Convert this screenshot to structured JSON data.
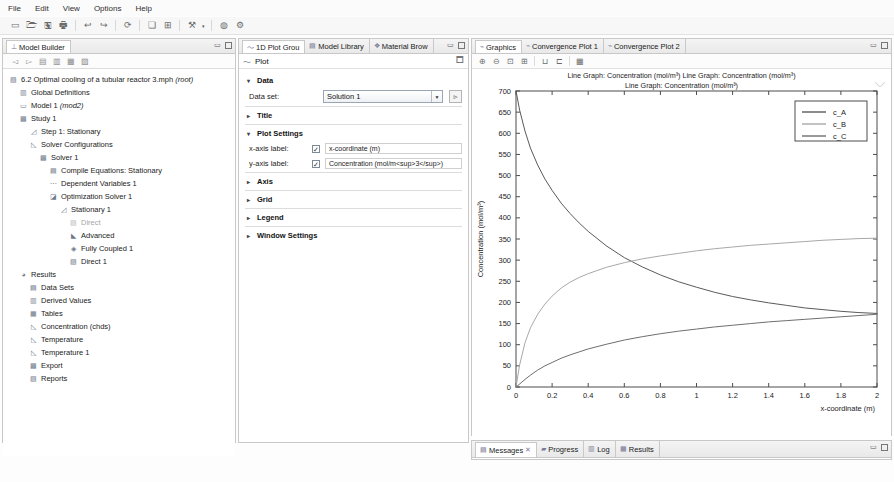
{
  "menubar": {
    "items": [
      {
        "label": "File"
      },
      {
        "label": "Edit"
      },
      {
        "label": "View"
      },
      {
        "label": "Options"
      },
      {
        "label": "Help"
      }
    ]
  },
  "toolbar": {
    "buttons": [
      {
        "name": "new-icon",
        "glyph": "▭"
      },
      {
        "name": "open-icon",
        "glyph": "🗁"
      },
      {
        "name": "save-icon",
        "glyph": "🖫"
      },
      {
        "name": "print-icon",
        "glyph": "🖶"
      },
      {
        "name": "undo-icon",
        "glyph": "↩"
      },
      {
        "name": "redo-icon",
        "glyph": "↪"
      },
      {
        "name": "refresh-icon",
        "glyph": "⟳"
      },
      {
        "name": "window-icon",
        "glyph": "❏"
      },
      {
        "name": "layout-icon",
        "glyph": "⊞"
      },
      {
        "name": "build-icon",
        "glyph": "⚒"
      },
      {
        "name": "dropdown-arrow-icon",
        "glyph": "▾"
      },
      {
        "name": "help-icon",
        "glyph": "◍"
      },
      {
        "name": "settings-icon",
        "glyph": "⚙"
      }
    ]
  },
  "model_builder": {
    "tab_label": "Model Builder",
    "tab_icon": "tree-icon",
    "toolbar_icons": [
      {
        "name": "collapse-icon",
        "glyph": "◅"
      },
      {
        "name": "expand-icon",
        "glyph": "▻"
      },
      {
        "name": "show-all-icon",
        "glyph": "▤"
      },
      {
        "name": "filter-icon",
        "glyph": "▥"
      },
      {
        "name": "group-icon",
        "glyph": "▦"
      },
      {
        "name": "list-icon",
        "glyph": "▨"
      }
    ],
    "tree": [
      {
        "label": "6.2 Optimal cooling of a tubular reactor 3.mph (root)",
        "indent": 0,
        "icon": "root-icon",
        "dim": false
      },
      {
        "label": "Global Definitions",
        "indent": 1,
        "icon": "globe-icon",
        "dim": false
      },
      {
        "label": "Model 1 (mod2)",
        "indent": 1,
        "icon": "model-icon",
        "dim": false
      },
      {
        "label": "Study 1",
        "indent": 1,
        "icon": "study-icon",
        "dim": false
      },
      {
        "label": "Step 1: Stationary",
        "indent": 2,
        "icon": "step-icon",
        "dim": false
      },
      {
        "label": "Solver Configurations",
        "indent": 2,
        "icon": "solver-config-icon",
        "dim": false
      },
      {
        "label": "Solver 1",
        "indent": 3,
        "icon": "solver-icon",
        "dim": false
      },
      {
        "label": "Compile Equations: Stationary",
        "indent": 4,
        "icon": "compile-icon",
        "dim": false
      },
      {
        "label": "Dependent Variables 1",
        "indent": 4,
        "icon": "variables-icon",
        "dim": false
      },
      {
        "label": "Optimization Solver 1",
        "indent": 4,
        "icon": "optimization-icon",
        "dim": false
      },
      {
        "label": "Stationary 1",
        "indent": 5,
        "icon": "stationary-icon",
        "dim": false
      },
      {
        "label": "Direct",
        "indent": 6,
        "icon": "direct-icon",
        "dim": true
      },
      {
        "label": "Advanced",
        "indent": 6,
        "icon": "advanced-icon",
        "dim": false
      },
      {
        "label": "Fully Coupled 1",
        "indent": 6,
        "icon": "fully-coupled-icon",
        "dim": false
      },
      {
        "label": "Direct 1",
        "indent": 6,
        "icon": "direct-icon",
        "dim": false
      },
      {
        "label": "Results",
        "indent": 1,
        "icon": "results-icon",
        "dim": false
      },
      {
        "label": "Data Sets",
        "indent": 2,
        "icon": "data-sets-icon",
        "dim": false
      },
      {
        "label": "Derived Values",
        "indent": 2,
        "icon": "derived-values-icon",
        "dim": false
      },
      {
        "label": "Tables",
        "indent": 2,
        "icon": "tables-icon",
        "dim": false
      },
      {
        "label": "Concentration (chds)",
        "indent": 2,
        "icon": "plot-group-icon",
        "dim": false
      },
      {
        "label": "Temperature",
        "indent": 2,
        "icon": "plot-group-icon",
        "dim": false
      },
      {
        "label": "Temperature 1",
        "indent": 2,
        "icon": "plot-group-icon",
        "dim": false
      },
      {
        "label": "Export",
        "indent": 2,
        "icon": "export-icon",
        "dim": false
      },
      {
        "label": "Reports",
        "indent": 2,
        "icon": "reports-icon",
        "dim": false
      }
    ]
  },
  "settings": {
    "tabs": [
      {
        "label": "1D Plot Grou",
        "icon": "plot-icon",
        "active": true
      },
      {
        "label": "Model Library",
        "icon": "library-icon",
        "active": false
      },
      {
        "label": "Material Brow",
        "icon": "material-icon",
        "active": false
      }
    ],
    "header": {
      "title": "Plot",
      "icon": "plot-icon",
      "right_icon": "window-icon"
    },
    "sections": {
      "data": {
        "title": "Data",
        "expanded": true,
        "dataset_label": "Data set:",
        "dataset_value": "Solution 1",
        "dataset_button_icon": "go-to-source-icon"
      },
      "title": {
        "title": "Title",
        "expanded": false
      },
      "plot_settings": {
        "title": "Plot Settings",
        "expanded": true,
        "x_axis_label_label": "x-axis label:",
        "x_axis_label_checked": true,
        "x_axis_label_value": "x-coordinate (m)",
        "y_axis_label_label": "y-axis label:",
        "y_axis_label_checked": true,
        "y_axis_label_value": "Concentration (mol/m<sup>3</sup>)"
      },
      "axis": {
        "title": "Axis",
        "expanded": false
      },
      "grid": {
        "title": "Grid",
        "expanded": false
      },
      "legend": {
        "title": "Legend",
        "expanded": false
      },
      "window_settings": {
        "title": "Window Settings",
        "expanded": false
      }
    }
  },
  "graphics": {
    "tabs": [
      {
        "label": "Graphics",
        "icon": "graphics-icon",
        "active": true
      },
      {
        "label": "Convergence Plot 1",
        "icon": "graphics-icon",
        "active": false
      },
      {
        "label": "Convergence Plot 2",
        "icon": "graphics-icon",
        "active": false
      }
    ],
    "toolbar_icons": [
      {
        "name": "zoom-in-icon",
        "glyph": "🔍"
      },
      {
        "name": "zoom-out-icon",
        "glyph": "🔎"
      },
      {
        "name": "zoom-box-icon",
        "glyph": "⛶"
      },
      {
        "name": "zoom-extents-icon",
        "glyph": "⊞"
      },
      {
        "name": "scene-light-icon",
        "glyph": "⊔"
      },
      {
        "name": "transparency-icon",
        "glyph": "⊏"
      },
      {
        "name": "snapshot-icon",
        "glyph": "📷"
      }
    ],
    "axes_badge": "⟍⟋"
  },
  "messages": {
    "tabs": [
      {
        "label": "Messages",
        "icon": "messages-icon",
        "active": true,
        "pin": "✕"
      },
      {
        "label": "Progress",
        "icon": "progress-icon",
        "active": false
      },
      {
        "label": "Log",
        "icon": "log-icon",
        "active": false
      },
      {
        "label": "Results",
        "icon": "results-table-icon",
        "active": false
      }
    ]
  },
  "chart_data": {
    "type": "line",
    "title_lines": [
      "Line Graph: Concentration (mol/m³)  Line Graph: Concentration (mol/m³)",
      "Line Graph: Concentration (mol/m³)"
    ],
    "xlabel": "x-coordinate (m)",
    "ylabel": "Concentration (mol/m³)",
    "xlim": [
      0,
      2
    ],
    "ylim": [
      0,
      700
    ],
    "xticks": [
      0,
      0.2,
      0.4,
      0.6,
      0.8,
      1,
      1.2,
      1.4,
      1.6,
      1.8,
      2
    ],
    "xtick_labels": [
      "0",
      "0.2",
      "0.4",
      "0.6",
      "0.8",
      "1",
      "1.2",
      "1.4",
      "1.6",
      "1.8",
      "2"
    ],
    "yticks": [
      0,
      50,
      100,
      150,
      200,
      250,
      300,
      350,
      400,
      450,
      500,
      550,
      600,
      650,
      700
    ],
    "ytick_labels": [
      "0",
      "50",
      "100",
      "150",
      "200",
      "250",
      "300",
      "350",
      "400",
      "450",
      "500",
      "550",
      "600",
      "650",
      "700"
    ],
    "grid": false,
    "legend_position": "top-right",
    "legend": [
      "c_A",
      "c_B",
      "c_C"
    ],
    "colors": {
      "c_A": "#5a5a5a",
      "c_B": "#a8a8a8",
      "c_C": "#6e6e6e"
    },
    "x": [
      0,
      0.02,
      0.05,
      0.08,
      0.12,
      0.16,
      0.2,
      0.25,
      0.3,
      0.35,
      0.4,
      0.5,
      0.6,
      0.7,
      0.8,
      0.9,
      1.0,
      1.1,
      1.2,
      1.3,
      1.4,
      1.5,
      1.6,
      1.7,
      1.8,
      1.9,
      2.0
    ],
    "series": [
      {
        "name": "c_A",
        "values": [
          700,
          655,
          605,
          565,
          525,
          492,
          465,
          435,
          410,
          388,
          368,
          334,
          306,
          284,
          265,
          249,
          236,
          224,
          214,
          206,
          199,
          193,
          187,
          183,
          179,
          176,
          174
        ]
      },
      {
        "name": "c_B",
        "values": [
          0,
          52,
          105,
          140,
          172,
          196,
          215,
          234,
          248,
          259,
          268,
          283,
          294,
          303,
          310,
          316,
          322,
          327,
          331,
          335,
          338,
          341,
          344,
          347,
          349,
          351,
          352
        ]
      },
      {
        "name": "c_C",
        "values": [
          0,
          7,
          18,
          28,
          40,
          50,
          58,
          68,
          76,
          83,
          90,
          101,
          111,
          119,
          126,
          132,
          137,
          142,
          146,
          150,
          154,
          157,
          160,
          163,
          166,
          169,
          172
        ]
      }
    ]
  }
}
